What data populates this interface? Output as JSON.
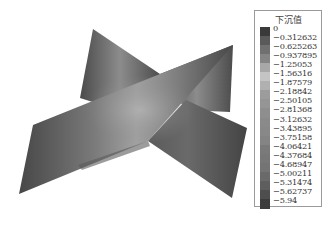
{
  "chart_data": {
    "type": "heatmap",
    "title": "下沉值",
    "legend": {
      "title": "下沉值",
      "position": "right",
      "levels": [
        "0",
        "-0.312632",
        "-0.625263",
        "-0.937895",
        "-1.25053",
        "-1.56316",
        "-1.87579",
        "-2.18842",
        "-2.50105",
        "-2.81368",
        "-3.12632",
        "-3.43895",
        "-3.75158",
        "-4.06421",
        "-4.37684",
        "-4.68947",
        "-5.00211",
        "-5.31474",
        "-5.62737",
        "-5.94"
      ],
      "colors": [
        "#3a3a3a",
        "#5a5a5a",
        "#707070",
        "#858585",
        "#a8a8a8",
        "#c4c4c4",
        "#b0b0b0",
        "#9c9c9c",
        "#959595",
        "#8e8e8e",
        "#8a8a8a",
        "#888888",
        "#848484",
        "#7a7a7a",
        "#777777",
        "#747474",
        "#6a6a6a",
        "#5e5e5e",
        "#4e4e4e",
        "#3c3c3c"
      ]
    },
    "range": [
      -5.94,
      0
    ]
  },
  "legend": {
    "title": "下沉值",
    "labels": [
      "0",
      "-0.312632",
      "-0.625263",
      "-0.937895",
      "-1.25053",
      "-1.56316",
      "-1.87579",
      "-2.18842",
      "-2.50105",
      "-2.81368",
      "-3.12632",
      "-3.43895",
      "-3.75158",
      "-4.06421",
      "-4.37684",
      "-4.68947",
      "-5.00211",
      "-5.31474",
      "-5.62737",
      "-5.94"
    ]
  }
}
